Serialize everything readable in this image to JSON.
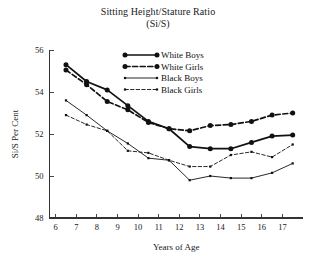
{
  "chart_data": {
    "type": "line",
    "title": "Sitting Height/Stature Ratio",
    "subtitle": "(Si/S)",
    "xlabel": "Years of Age",
    "ylabel": "Si/S Per Cent",
    "xlim": [
      5.7,
      18.0
    ],
    "ylim": [
      48,
      56
    ],
    "grid": false,
    "legend_position": "top-center-right",
    "xticks": [
      6,
      7,
      8,
      9,
      10,
      11,
      12,
      13,
      14,
      15,
      16,
      17
    ],
    "xtick_labels": [
      "6",
      "7",
      "8",
      "9",
      "10",
      "11",
      "12",
      "13",
      "14",
      "15",
      "16",
      "17"
    ],
    "yticks": [
      48,
      50,
      52,
      54,
      56
    ],
    "ytick_labels": [
      "48",
      "50",
      "52",
      "54",
      "56"
    ],
    "x": [
      6.5,
      7.5,
      8.5,
      9.5,
      10.5,
      11.5,
      12.5,
      13.5,
      14.5,
      15.5,
      16.5,
      17.5
    ],
    "series": [
      {
        "name": "White Boys",
        "style": "solid",
        "width": "thick",
        "marker": "circle-large",
        "values": [
          55.3,
          54.5,
          54.1,
          53.35,
          52.6,
          52.25,
          51.4,
          51.3,
          51.3,
          51.6,
          51.9,
          51.95
        ]
      },
      {
        "name": "White Girls",
        "style": "dashed",
        "width": "thick",
        "marker": "circle-large",
        "values": [
          55.05,
          54.35,
          53.55,
          53.15,
          52.55,
          52.25,
          52.15,
          52.4,
          52.45,
          52.6,
          52.9,
          53.0
        ]
      },
      {
        "name": "Black Boys",
        "style": "solid",
        "width": "thin",
        "marker": "square-small",
        "values": [
          53.6,
          52.9,
          52.15,
          51.55,
          50.85,
          50.75,
          49.8,
          50.0,
          49.9,
          49.9,
          50.15,
          50.6
        ]
      },
      {
        "name": "Black Girls",
        "style": "dashed",
        "width": "thin",
        "marker": "square-small",
        "values": [
          52.9,
          52.45,
          52.15,
          51.2,
          51.1,
          50.75,
          50.45,
          50.45,
          51.0,
          51.15,
          50.9,
          51.5
        ]
      }
    ]
  },
  "colors": {
    "ink": "#111111",
    "axis": "#333333",
    "background": "#ffffff"
  }
}
